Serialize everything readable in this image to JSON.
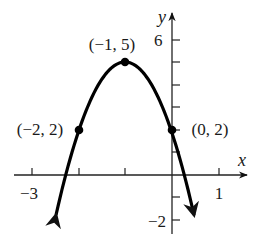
{
  "chart_data": {
    "type": "line",
    "title": "",
    "function": "y = -(x+1)^2 + 5",
    "xlabel": "x",
    "ylabel": "y",
    "x_tick_labels": [
      {
        "value": -3,
        "label": "−3"
      },
      {
        "value": 1,
        "label": "1"
      }
    ],
    "y_tick_labels": [
      {
        "value": 6,
        "label": "6"
      },
      {
        "value": -2,
        "label": "−2"
      }
    ],
    "x_ticks": [
      -3,
      -2,
      -1,
      0,
      1
    ],
    "y_ticks": [
      -2,
      -1,
      1,
      2,
      3,
      4,
      5,
      6
    ],
    "grid": false,
    "legend": null,
    "points": [
      {
        "x": -1,
        "y": 5,
        "label": "(−1, 5)"
      },
      {
        "x": -2,
        "y": 2,
        "label": "(−2, 2)"
      },
      {
        "x": 0,
        "y": 2,
        "label": "(0, 2)"
      }
    ],
    "curve_ends_with_arrows": true,
    "color": "#000000"
  },
  "labels": {
    "x_axis": "x",
    "y_axis": "y",
    "tick_x_neg3": "−3",
    "tick_x_1": "1",
    "tick_y_6": "6",
    "tick_y_neg2": "−2",
    "vertex": "(−1, 5)",
    "left_point": "(−2, 2)",
    "right_point": "(0, 2)"
  }
}
